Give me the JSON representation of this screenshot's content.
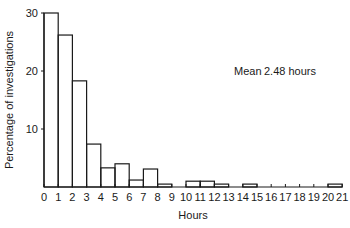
{
  "chart_data": {
    "type": "bar",
    "title": "",
    "xlabel": "Hours",
    "ylabel": "Percentage of investigations",
    "x_ticks": [
      "0",
      "1",
      "2",
      "3",
      "4",
      "5",
      "6",
      "7",
      "8",
      "9",
      "10",
      "11",
      "12",
      "13",
      "14",
      "15",
      "16",
      "17",
      "18",
      "19",
      "20",
      "21"
    ],
    "y_ticks": [
      "10",
      "20",
      "30"
    ],
    "ylim": [
      0,
      30
    ],
    "xlim": [
      0,
      21
    ],
    "grid": false,
    "bins": [
      {
        "from": 0,
        "to": 1,
        "value": 30.0
      },
      {
        "from": 1,
        "to": 2,
        "value": 26.2
      },
      {
        "from": 2,
        "to": 3,
        "value": 18.3
      },
      {
        "from": 3,
        "to": 4,
        "value": 7.4
      },
      {
        "from": 4,
        "to": 5,
        "value": 3.3
      },
      {
        "from": 5,
        "to": 6,
        "value": 4.0
      },
      {
        "from": 6,
        "to": 7,
        "value": 1.2
      },
      {
        "from": 7,
        "to": 8,
        "value": 3.1
      },
      {
        "from": 8,
        "to": 9,
        "value": 0.5
      },
      {
        "from": 9,
        "to": 10,
        "value": 0
      },
      {
        "from": 10,
        "to": 11,
        "value": 1.0
      },
      {
        "from": 11,
        "to": 12,
        "value": 1.0
      },
      {
        "from": 12,
        "to": 13,
        "value": 0.5
      },
      {
        "from": 13,
        "to": 14,
        "value": 0
      },
      {
        "from": 14,
        "to": 15,
        "value": 0.5
      },
      {
        "from": 15,
        "to": 16,
        "value": 0
      },
      {
        "from": 16,
        "to": 17,
        "value": 0
      },
      {
        "from": 17,
        "to": 18,
        "value": 0
      },
      {
        "from": 18,
        "to": 19,
        "value": 0
      },
      {
        "from": 19,
        "to": 20,
        "value": 0
      },
      {
        "from": 20,
        "to": 21,
        "value": 0.5
      }
    ],
    "annotations": [
      {
        "label": "Mean",
        "value": "2.48 hours"
      }
    ]
  },
  "colors": {
    "ink": "#1a1a1a",
    "background": "#ffffff"
  }
}
